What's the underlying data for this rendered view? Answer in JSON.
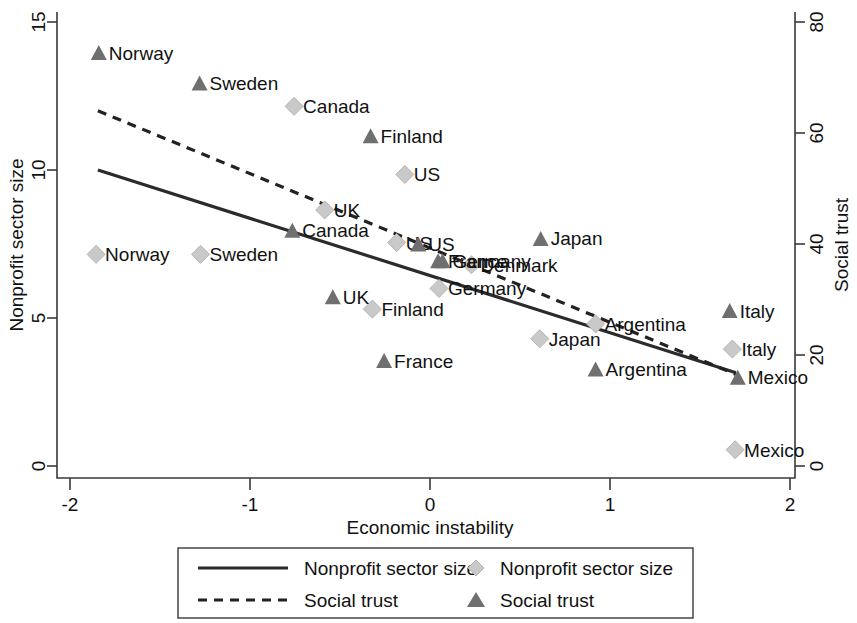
{
  "chart_data": {
    "type": "scatter",
    "title": "",
    "xlabel": "Economic instability",
    "ylabel_left": "Nonprofit sector size",
    "ylabel_right": "Social trust",
    "xlim": [
      -2,
      2
    ],
    "ylim_left": [
      0,
      15
    ],
    "ylim_right": [
      0,
      80
    ],
    "xticks": [
      "-2",
      "-1",
      "0",
      "1",
      "2"
    ],
    "xtick_values": [
      -2,
      -1,
      0,
      1,
      2
    ],
    "yticks_left": [
      "0",
      "5",
      "10",
      "15"
    ],
    "ytick_left_values": [
      0,
      5,
      10,
      15
    ],
    "yticks_right": [
      "0",
      "20",
      "40",
      "60",
      "80"
    ],
    "ytick_right_values": [
      0,
      20,
      40,
      60,
      80
    ],
    "grid": false,
    "legend_position": "bottom",
    "series": [
      {
        "name": "Nonprofit sector size",
        "marker": "diamond",
        "color": "#c9c9c9",
        "axis": "left",
        "points": [
          {
            "label": "Norway",
            "x": -1.855,
            "y": 7.15
          },
          {
            "label": "Sweden",
            "x": -1.275,
            "y": 7.15
          },
          {
            "label": "Canada",
            "x": -0.755,
            "y": 12.15
          },
          {
            "label": "UK",
            "x": -0.585,
            "y": 8.65
          },
          {
            "label": "US",
            "x": -0.14,
            "y": 9.85
          },
          {
            "label": "Finland",
            "x": -0.32,
            "y": 5.3
          },
          {
            "label": "US",
            "x": -0.185,
            "y": 7.55
          },
          {
            "label": "Denmark",
            "x": 0.23,
            "y": 6.8
          },
          {
            "label": "Germany",
            "x": 0.05,
            "y": 6.0
          },
          {
            "label": "Japan",
            "x": 0.61,
            "y": 4.3
          },
          {
            "label": "Argentina",
            "x": 0.92,
            "y": 4.8
          },
          {
            "label": "Italy",
            "x": 1.68,
            "y": 3.95
          },
          {
            "label": "Mexico",
            "x": 1.695,
            "y": 0.55
          }
        ]
      },
      {
        "name": "Social trust",
        "marker": "triangle",
        "color": "#6f6f6f",
        "axis": "right",
        "points": [
          {
            "label": "Norway",
            "x": -1.84,
            "y": 74.5
          },
          {
            "label": "Sweden",
            "x": -1.28,
            "y": 69.0
          },
          {
            "label": "Finland",
            "x": -0.33,
            "y": 59.5
          },
          {
            "label": "Canada",
            "x": -0.765,
            "y": 42.5
          },
          {
            "label": "US",
            "x": -0.065,
            "y": 40.0
          },
          {
            "label": "France",
            "x": 0.045,
            "y": 37.0
          },
          {
            "label": "Germany",
            "x": 0.07,
            "y": 37.0
          },
          {
            "label": "UK",
            "x": -0.54,
            "y": 30.5
          },
          {
            "label": "Japan",
            "x": 0.615,
            "y": 41.0
          },
          {
            "label": "Italy",
            "x": 1.665,
            "y": 28.0
          },
          {
            "label": "France",
            "x": -0.255,
            "y": 19.0
          },
          {
            "label": "Argentina",
            "x": 0.92,
            "y": 17.5
          },
          {
            "label": "Mexico",
            "x": 1.71,
            "y": 16.0
          }
        ]
      }
    ],
    "fit_lines": [
      {
        "name": "Nonprofit sector size",
        "style": "solid",
        "axis": "left",
        "x_start": -1.845,
        "y_start": 10.0,
        "x_end": 1.7,
        "y_end": 3.15
      },
      {
        "name": "Social trust",
        "style": "dashed",
        "axis": "right",
        "x_start": -1.845,
        "y_start": 64.0,
        "x_end": 1.7,
        "y_end": 16.5
      }
    ]
  },
  "legend": {
    "entries": [
      {
        "label": "Nonprofit sector size",
        "symbol": "solid-line"
      },
      {
        "label": "Social trust",
        "symbol": "dashed-line"
      },
      {
        "label": "Nonprofit sector size",
        "symbol": "diamond"
      },
      {
        "label": "Social trust",
        "symbol": "triangle"
      }
    ]
  },
  "colors": {
    "triangle": "#6f6f6f",
    "diamond": "#c9c9c9",
    "line": "#2b2b2b",
    "axis": "#3a3a3a",
    "text": "#111111"
  },
  "label_offsets": {
    "note": "rendered label positions are layout, values above are data"
  }
}
